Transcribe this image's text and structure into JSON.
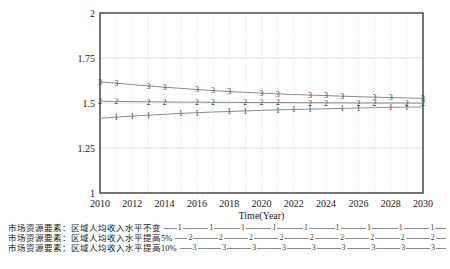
{
  "chart_data": {
    "type": "line",
    "title": "",
    "xlabel": "Time(Year)",
    "ylabel": "",
    "xlim": [
      2010,
      2030
    ],
    "ylim": [
      1,
      2
    ],
    "xticks": [
      2010,
      2012,
      2014,
      2016,
      2018,
      2020,
      2022,
      2024,
      2026,
      2028,
      2030
    ],
    "ytick_labels": [
      "1",
      "1.25",
      "1.5",
      "1.75",
      "2"
    ],
    "yticks": [
      1,
      1.25,
      1.5,
      1.75,
      2
    ],
    "grid": true,
    "legend_position": "bottom",
    "x": [
      2010,
      2011,
      2012,
      2013,
      2014,
      2015,
      2016,
      2017,
      2018,
      2019,
      2020,
      2021,
      2022,
      2023,
      2024,
      2025,
      2026,
      2027,
      2028,
      2029,
      2030
    ],
    "series": [
      {
        "name": "市场资源要素：区域人均收入水平不变",
        "marker": "1",
        "values": [
          1.415,
          1.421,
          1.427,
          1.432,
          1.437,
          1.442,
          1.446,
          1.45,
          1.453,
          1.456,
          1.459,
          1.462,
          1.464,
          1.466,
          1.468,
          1.47,
          1.472,
          1.474,
          1.476,
          1.477,
          1.478
        ]
      },
      {
        "name": "市场资源要素：区域人均收入水平提高5%",
        "marker": "2",
        "values": [
          1.51,
          1.509,
          1.508,
          1.507,
          1.506,
          1.505,
          1.505,
          1.504,
          1.504,
          1.503,
          1.503,
          1.502,
          1.502,
          1.501,
          1.501,
          1.501,
          1.5,
          1.5,
          1.5,
          1.5,
          1.499
        ]
      },
      {
        "name": "市场资源要素：区域人均收入水平提高10%",
        "marker": "3",
        "values": [
          1.618,
          1.61,
          1.602,
          1.595,
          1.588,
          1.581,
          1.575,
          1.569,
          1.564,
          1.559,
          1.555,
          1.551,
          1.547,
          1.544,
          1.541,
          1.538,
          1.535,
          1.533,
          1.53,
          1.528,
          1.526
        ]
      }
    ]
  },
  "colors": {
    "background": "#ffffff",
    "frame": "#3d3d3d",
    "grid": "#d9d9d9",
    "line": "#8c8c8c",
    "marker_text": "#3f3f3f",
    "text": "#1a1a1a"
  }
}
